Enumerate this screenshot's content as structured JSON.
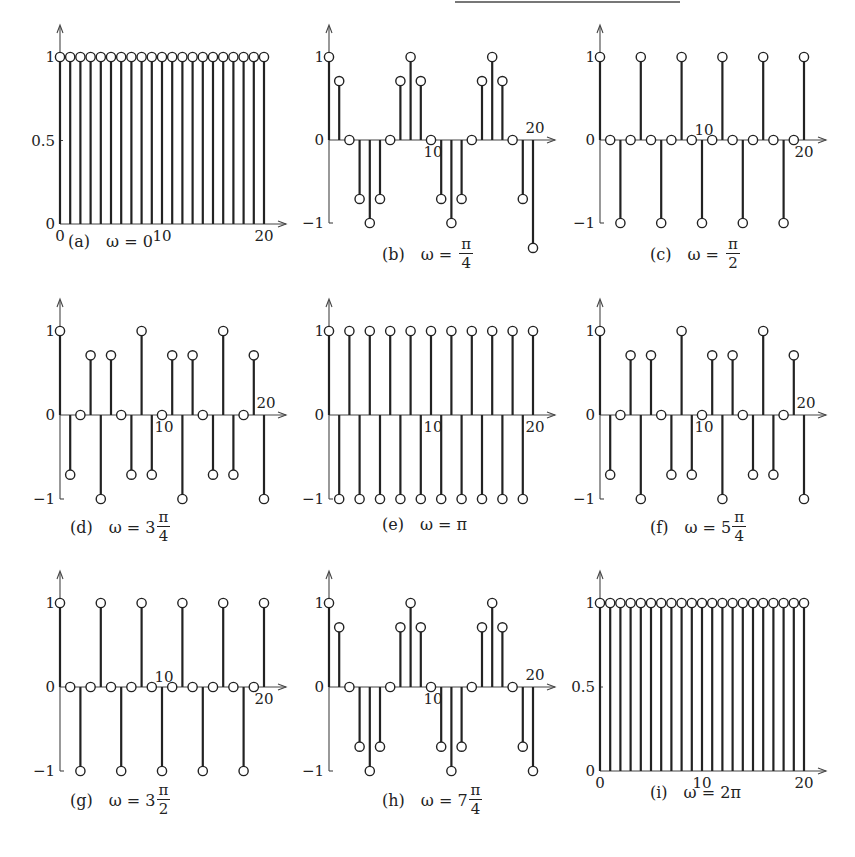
{
  "chart_data": [
    {
      "id": "a",
      "type": "stem",
      "caption_label": "(a)",
      "caption_expr": "ω = 0",
      "omega": "0",
      "omega_parts": {
        "prefix": "ω = 0",
        "coef": "",
        "num": "",
        "den": ""
      },
      "xlabel": "n",
      "ylabel": "x[n]",
      "xlim": [
        0,
        20
      ],
      "ylim": [
        0,
        1
      ],
      "xticks": [
        0,
        10,
        20
      ],
      "yticks": [
        0,
        0.5,
        1
      ],
      "ytick_labels": [
        "0",
        "0.5",
        "1"
      ],
      "n": [
        0,
        1,
        2,
        3,
        4,
        5,
        6,
        7,
        8,
        9,
        10,
        11,
        12,
        13,
        14,
        15,
        16,
        17,
        18,
        19,
        20
      ],
      "values": [
        1,
        1,
        1,
        1,
        1,
        1,
        1,
        1,
        1,
        1,
        1,
        1,
        1,
        1,
        1,
        1,
        1,
        1,
        1,
        1,
        1
      ]
    },
    {
      "id": "b",
      "type": "stem",
      "caption_label": "(b)",
      "caption_expr": "ω = π/4",
      "omega": "π/4",
      "omega_parts": {
        "prefix": "ω =",
        "coef": "",
        "num": "π",
        "den": "4"
      },
      "xlabel": "n",
      "ylabel": "x[n]",
      "xlim": [
        0,
        20
      ],
      "ylim": [
        -1,
        1
      ],
      "xticks": [
        10,
        20
      ],
      "yticks": [
        -1,
        0,
        1
      ],
      "ytick_labels": [
        "−1",
        "0",
        "1"
      ],
      "n": [
        0,
        1,
        2,
        3,
        4,
        5,
        6,
        7,
        8,
        9,
        10,
        11,
        12,
        13,
        14,
        15,
        16,
        17,
        18,
        19,
        20
      ],
      "values": [
        1,
        0.71,
        0,
        -0.71,
        -1,
        -0.71,
        0,
        0.71,
        1,
        0.71,
        0,
        -0.71,
        -1,
        -0.71,
        0,
        0.71,
        1,
        0.71,
        0,
        -0.71,
        -1.3
      ]
    },
    {
      "id": "c",
      "type": "stem",
      "caption_label": "(c)",
      "caption_expr": "ω = π/2",
      "omega": "π/2",
      "omega_parts": {
        "prefix": "ω =",
        "coef": "",
        "num": "π",
        "den": "2"
      },
      "xlabel": "n",
      "ylabel": "x[n]",
      "xlim": [
        0,
        20
      ],
      "ylim": [
        -1,
        1
      ],
      "xticks": [
        10,
        20
      ],
      "yticks": [
        -1,
        0,
        1
      ],
      "ytick_labels": [
        "−1",
        "0",
        "1"
      ],
      "n": [
        0,
        1,
        2,
        3,
        4,
        5,
        6,
        7,
        8,
        9,
        10,
        11,
        12,
        13,
        14,
        15,
        16,
        17,
        18,
        19,
        20
      ],
      "values": [
        1,
        0,
        -1,
        0,
        1,
        0,
        -1,
        0,
        1,
        0,
        -1,
        0,
        1,
        0,
        -1,
        0,
        1,
        0,
        -1,
        0,
        1
      ]
    },
    {
      "id": "d",
      "type": "stem",
      "caption_label": "(d)",
      "caption_expr": "ω = 3π/4",
      "omega": "3π/4",
      "omega_parts": {
        "prefix": "ω = 3",
        "coef": "3",
        "num": "π",
        "den": "4"
      },
      "xlabel": "n",
      "ylabel": "x[n]",
      "xlim": [
        0,
        20
      ],
      "ylim": [
        -1,
        1
      ],
      "xticks": [
        10,
        20
      ],
      "yticks": [
        -1,
        0,
        1
      ],
      "ytick_labels": [
        "−1",
        "0",
        "1"
      ],
      "n": [
        0,
        1,
        2,
        3,
        4,
        5,
        6,
        7,
        8,
        9,
        10,
        11,
        12,
        13,
        14,
        15,
        16,
        17,
        18,
        19,
        20
      ],
      "values": [
        1,
        -0.71,
        0,
        0.71,
        -1,
        0.71,
        0,
        -0.71,
        1,
        -0.71,
        0,
        0.71,
        -1,
        0.71,
        0,
        -0.71,
        1,
        -0.71,
        0,
        0.71,
        -1
      ]
    },
    {
      "id": "e",
      "type": "stem",
      "caption_label": "(e)",
      "caption_expr": "ω = π",
      "omega": "π",
      "omega_parts": {
        "prefix": "ω = π",
        "coef": "",
        "num": "",
        "den": ""
      },
      "xlabel": "n",
      "ylabel": "x[n]",
      "xlim": [
        0,
        20
      ],
      "ylim": [
        -1,
        1
      ],
      "xticks": [
        10,
        20
      ],
      "yticks": [
        -1,
        0,
        1
      ],
      "ytick_labels": [
        "−1",
        "0",
        "1"
      ],
      "n": [
        0,
        1,
        2,
        3,
        4,
        5,
        6,
        7,
        8,
        9,
        10,
        11,
        12,
        13,
        14,
        15,
        16,
        17,
        18,
        19,
        20
      ],
      "values": [
        1,
        -1,
        1,
        -1,
        1,
        -1,
        1,
        -1,
        1,
        -1,
        1,
        -1,
        1,
        -1,
        1,
        -1,
        1,
        -1,
        1,
        -1,
        1
      ]
    },
    {
      "id": "f",
      "type": "stem",
      "caption_label": "(f)",
      "caption_expr": "ω = 5π/4",
      "omega": "5π/4",
      "omega_parts": {
        "prefix": "ω = 5",
        "coef": "5",
        "num": "π",
        "den": "4"
      },
      "xlabel": "n",
      "ylabel": "x[n]",
      "xlim": [
        0,
        20
      ],
      "ylim": [
        -1,
        1
      ],
      "xticks": [
        10,
        20
      ],
      "yticks": [
        -1,
        0,
        1
      ],
      "ytick_labels": [
        "−1",
        "0",
        "1"
      ],
      "n": [
        0,
        1,
        2,
        3,
        4,
        5,
        6,
        7,
        8,
        9,
        10,
        11,
        12,
        13,
        14,
        15,
        16,
        17,
        18,
        19,
        20
      ],
      "values": [
        1,
        -0.71,
        0,
        0.71,
        -1,
        0.71,
        0,
        -0.71,
        1,
        -0.71,
        0,
        0.71,
        -1,
        0.71,
        0,
        -0.71,
        1,
        -0.71,
        0,
        0.71,
        -1
      ]
    },
    {
      "id": "g",
      "type": "stem",
      "caption_label": "(g)",
      "caption_expr": "ω = 3π/2",
      "omega": "3π/2",
      "omega_parts": {
        "prefix": "ω = 3",
        "coef": "3",
        "num": "π",
        "den": "2"
      },
      "xlabel": "n",
      "ylabel": "x[n]",
      "xlim": [
        0,
        20
      ],
      "ylim": [
        -1,
        1
      ],
      "xticks": [
        10,
        20
      ],
      "yticks": [
        -1,
        0,
        1
      ],
      "ytick_labels": [
        "−1",
        "0",
        "1"
      ],
      "n": [
        0,
        1,
        2,
        3,
        4,
        5,
        6,
        7,
        8,
        9,
        10,
        11,
        12,
        13,
        14,
        15,
        16,
        17,
        18,
        19,
        20
      ],
      "values": [
        1,
        0,
        -1,
        0,
        1,
        0,
        -1,
        0,
        1,
        0,
        -1,
        0,
        1,
        0,
        -1,
        0,
        1,
        0,
        -1,
        0,
        1
      ]
    },
    {
      "id": "h",
      "type": "stem",
      "caption_label": "(h)",
      "caption_expr": "ω = 7π/4",
      "omega": "7π/4",
      "omega_parts": {
        "prefix": "ω = 7",
        "coef": "7",
        "num": "π",
        "den": "4"
      },
      "xlabel": "n",
      "ylabel": "x[n]",
      "xlim": [
        0,
        20
      ],
      "ylim": [
        -1,
        1
      ],
      "xticks": [
        10,
        20
      ],
      "yticks": [
        -1,
        0,
        1
      ],
      "ytick_labels": [
        "−1",
        "0",
        "1"
      ],
      "n": [
        0,
        1,
        2,
        3,
        4,
        5,
        6,
        7,
        8,
        9,
        10,
        11,
        12,
        13,
        14,
        15,
        16,
        17,
        18,
        19,
        20
      ],
      "values": [
        1,
        0.71,
        0,
        -0.71,
        -1,
        -0.71,
        0,
        0.71,
        1,
        0.71,
        0,
        -0.71,
        -1,
        -0.71,
        0,
        0.71,
        1,
        0.71,
        0,
        -0.71,
        -1
      ]
    },
    {
      "id": "i",
      "type": "stem",
      "caption_label": "(i)",
      "caption_expr": "ω = 2π",
      "omega": "2π",
      "omega_parts": {
        "prefix": "ω = 2π",
        "coef": "",
        "num": "",
        "den": ""
      },
      "xlabel": "n",
      "ylabel": "x[n]",
      "xlim": [
        0,
        20
      ],
      "ylim": [
        0,
        1
      ],
      "xticks": [
        0,
        10,
        20
      ],
      "yticks": [
        0,
        0.5,
        1
      ],
      "ytick_labels": [
        "0",
        "0.5",
        "1"
      ],
      "n": [
        0,
        1,
        2,
        3,
        4,
        5,
        6,
        7,
        8,
        9,
        10,
        11,
        12,
        13,
        14,
        15,
        16,
        17,
        18,
        19,
        20
      ],
      "values": [
        1,
        1,
        1,
        1,
        1,
        1,
        1,
        1,
        1,
        1,
        1,
        1,
        1,
        1,
        1,
        1,
        1,
        1,
        1,
        1,
        1
      ]
    }
  ],
  "layout": {
    "panels": [
      {
        "x0": 60,
        "y_top": 57,
        "y_bot": 224,
        "unit": 10.2,
        "cap_x": 68,
        "cap_y": 232,
        "x_ticks_below": true
      },
      {
        "x0": 329,
        "y_top": 57,
        "y_mid": 140,
        "y_bot": 223,
        "unit": 10.2,
        "cap_x": 382,
        "cap_y": 237
      },
      {
        "x0": 600,
        "y_top": 57,
        "y_mid": 140,
        "y_bot": 223,
        "unit": 10.2,
        "cap_x": 650,
        "cap_y": 237
      },
      {
        "x0": 60,
        "y_top": 331,
        "y_mid": 415,
        "y_bot": 499,
        "unit": 10.2,
        "cap_x": 70,
        "cap_y": 510
      },
      {
        "x0": 329,
        "y_top": 331,
        "y_mid": 415,
        "y_bot": 499,
        "unit": 10.2,
        "cap_x": 382,
        "cap_y": 515
      },
      {
        "x0": 600,
        "y_top": 331,
        "y_mid": 415,
        "y_bot": 499,
        "unit": 10.2,
        "cap_x": 650,
        "cap_y": 510
      },
      {
        "x0": 60,
        "y_top": 603,
        "y_mid": 687,
        "y_bot": 771,
        "unit": 10.2,
        "cap_x": 70,
        "cap_y": 783
      },
      {
        "x0": 329,
        "y_top": 603,
        "y_mid": 687,
        "y_bot": 771,
        "unit": 10.2,
        "cap_x": 382,
        "cap_y": 783
      },
      {
        "x0": 600,
        "y_top": 603,
        "y_bot": 771,
        "unit": 10.2,
        "cap_x": 650,
        "cap_y": 783,
        "x_ticks_below": true
      }
    ]
  },
  "colors": {
    "ink": "#222222",
    "axis": "#444444",
    "marker_fill": "#ffffff"
  }
}
